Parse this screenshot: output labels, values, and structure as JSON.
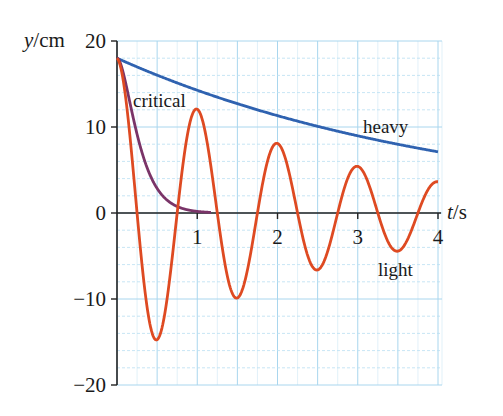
{
  "chart_data": {
    "type": "line",
    "title": "",
    "xlabel": "t/s",
    "ylabel": "y/cm",
    "xlim": [
      0,
      4
    ],
    "ylim": [
      -20,
      20
    ],
    "x_ticks": [
      "1",
      "2",
      "3",
      "4"
    ],
    "y_ticks": [
      "20",
      "10",
      "0",
      "−10",
      "−20"
    ],
    "grid": true,
    "legend": "inline labels",
    "series": [
      {
        "name": "heavy",
        "color": "#2f62b0",
        "x": [
          0,
          0.5,
          1,
          1.5,
          2,
          2.5,
          3,
          3.5,
          4
        ],
        "values": [
          18,
          16.0,
          14.3,
          12.7,
          11.3,
          10.1,
          9.0,
          8.0,
          7.1
        ]
      },
      {
        "name": "critical",
        "color": "#7a3468",
        "x": [
          0,
          0.125,
          0.25,
          0.375,
          0.5,
          0.625,
          0.75,
          0.875,
          1.0,
          1.15
        ],
        "values": [
          18,
          14.3,
          9.2,
          6.5,
          5.0,
          2.8,
          1.6,
          0.9,
          0.5,
          0.2
        ]
      },
      {
        "name": "light",
        "color": "#de4a22",
        "x": [
          0,
          0.25,
          0.5,
          0.75,
          1.0,
          1.25,
          1.5,
          1.75,
          2.0,
          2.25,
          2.5,
          2.75,
          3.0,
          3.25,
          3.5,
          3.75,
          4.0
        ],
        "values": [
          18,
          0,
          -14.8,
          0,
          12.1,
          0,
          -10.0,
          0,
          8.1,
          0,
          -6.6,
          0,
          5.6,
          0,
          -4.3,
          0,
          3.6
        ]
      }
    ],
    "annotations": [
      {
        "text": "critical",
        "x": 0.2,
        "y": 12.5
      },
      {
        "text": "heavy",
        "x": 3.35,
        "y": 9.4
      },
      {
        "text": "light",
        "x": 3.25,
        "y": -6.9
      }
    ]
  },
  "labels": {
    "ylabel_var": "y",
    "ylabel_unit": "/cm",
    "xlabel_var": "t",
    "xlabel_unit": "/s",
    "critical": "critical",
    "heavy": "heavy",
    "light": "light"
  }
}
